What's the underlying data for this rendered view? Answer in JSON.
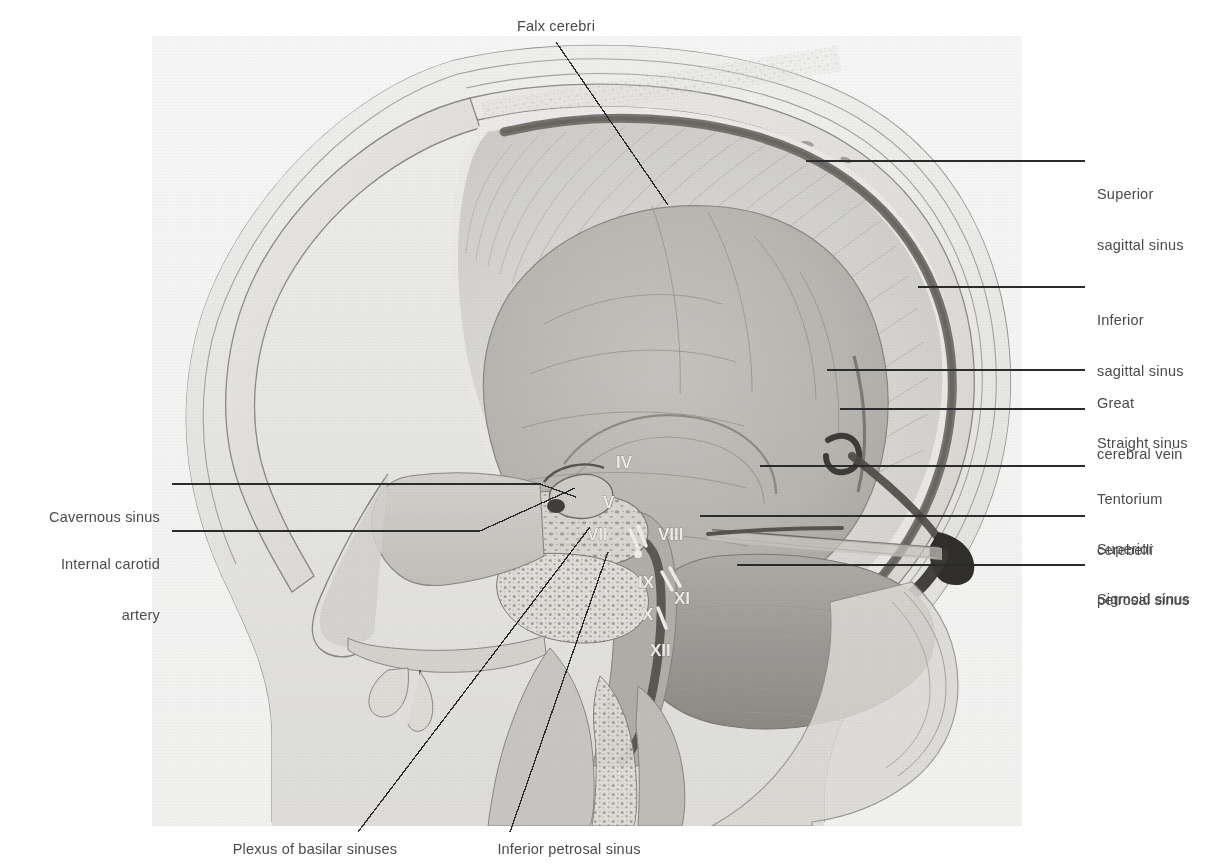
{
  "figure": {
    "kind": "anatomical-illustration",
    "plate_bg": "#fafafa",
    "label_color": "#4a4a4a"
  },
  "labels": {
    "top": [
      {
        "id": "falx-cerebri",
        "text": "Falx cerebri"
      }
    ],
    "right": [
      {
        "id": "superior-sagittal-sinus",
        "line1": "Superior",
        "line2": "sagittal sinus"
      },
      {
        "id": "inferior-sagittal-sinus",
        "line1": "Inferior",
        "line2": "sagittal sinus"
      },
      {
        "id": "great-cerebral-vein",
        "line1": "Great",
        "line2": "cerebral vein"
      },
      {
        "id": "straight-sinus",
        "line1": "Straight sinus",
        "line2": ""
      },
      {
        "id": "tentorium-cerebelli",
        "line1": "Tentorium",
        "line2": "cerebelli"
      },
      {
        "id": "superior-petrosal-sinus",
        "line1": "Superior",
        "line2": "petrosal sinus"
      },
      {
        "id": "sigmoid-sinus",
        "line1": "Sigmoid sinus",
        "line2": ""
      }
    ],
    "left": [
      {
        "id": "cavernous-sinus",
        "line1": "Cavernous sinus",
        "line2": ""
      },
      {
        "id": "internal-carotid-artery",
        "line1": "Internal carotid",
        "line2": "artery"
      }
    ],
    "bottom": [
      {
        "id": "plexus-of-basilar-sinuses",
        "text": "Plexus of basilar sinuses"
      },
      {
        "id": "inferior-petrosal-sinus",
        "text": "Inferior petrosal sinus"
      }
    ]
  },
  "cranial_nerves": [
    {
      "id": "cn-iv",
      "numeral": "IV"
    },
    {
      "id": "cn-v",
      "numeral": "V"
    },
    {
      "id": "cn-vii",
      "numeral": "VII"
    },
    {
      "id": "cn-viii",
      "numeral": "VIII"
    },
    {
      "id": "cn-ix",
      "numeral": "IX"
    },
    {
      "id": "cn-x",
      "numeral": "X"
    },
    {
      "id": "cn-xi",
      "numeral": "XI"
    },
    {
      "id": "cn-xii",
      "numeral": "XII"
    }
  ]
}
